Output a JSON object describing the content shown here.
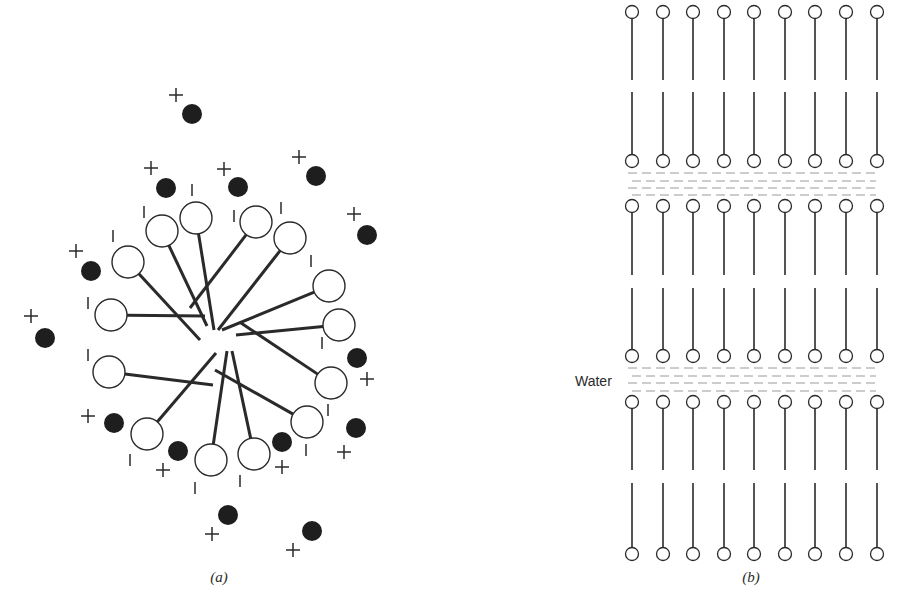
{
  "figure": {
    "panels": [
      {
        "id": "a",
        "label": "(a)",
        "description": "Spherical micelle with counter-ions",
        "micelle_center": [
          220,
          335
        ],
        "amphiphiles": [
          {
            "head": [
              111,
              315
            ],
            "tail_end": [
              205,
              316
            ],
            "charge": "|",
            "charge_pos": [
              88,
              303
            ]
          },
          {
            "head": [
              128,
              262
            ],
            "tail_end": [
              200,
              340
            ],
            "charge": "|",
            "charge_pos": [
              113,
              236
            ]
          },
          {
            "head": [
              162,
              231
            ],
            "tail_end": [
              207,
              326
            ],
            "charge": "|",
            "charge_pos": [
              144,
              212
            ]
          },
          {
            "head": [
              196,
              218
            ],
            "tail_end": [
              214,
              330
            ],
            "charge": "|",
            "charge_pos": [
              192,
              190
            ]
          },
          {
            "head": [
              256,
              222
            ],
            "tail_end": [
              190,
              308
            ],
            "charge": "|",
            "charge_pos": [
              234,
              216
            ]
          },
          {
            "head": [
              290,
              238
            ],
            "tail_end": [
              218,
              330
            ],
            "charge": "|",
            "charge_pos": [
              281,
              208
            ]
          },
          {
            "head": [
              329,
              286
            ],
            "tail_end": [
              222,
              330
            ],
            "charge": "|",
            "charge_pos": [
              311,
              261
            ]
          },
          {
            "head": [
              339,
              325
            ],
            "tail_end": [
              236,
              335
            ],
            "charge": "|",
            "charge_pos": [
              322,
              343
            ]
          },
          {
            "head": [
              331,
              383
            ],
            "tail_end": [
              241,
              323
            ],
            "charge": "|",
            "charge_pos": [
              328,
              410
            ]
          },
          {
            "head": [
              307,
              422
            ],
            "tail_end": [
              215,
              370
            ],
            "charge": "|",
            "charge_pos": [
              306,
              450
            ]
          },
          {
            "head": [
              254,
              454
            ],
            "tail_end": [
              232,
              351
            ],
            "charge": "|",
            "charge_pos": [
              240,
              481
            ]
          },
          {
            "head": [
              211,
              460
            ],
            "tail_end": [
              227,
              351
            ],
            "charge": "|",
            "charge_pos": [
              195,
              488
            ]
          },
          {
            "head": [
              147,
              434
            ],
            "tail_end": [
              216,
              353
            ],
            "charge": "|",
            "charge_pos": [
              130,
              460
            ]
          },
          {
            "head": [
              109,
              372
            ],
            "tail_end": [
              213,
              385
            ],
            "charge": "|",
            "charge_pos": [
              88,
              355
            ]
          }
        ],
        "counter_ions": [
          {
            "ion": [
              192,
              114
            ],
            "sign": "+",
            "sign_pos": [
              176,
              95
            ]
          },
          {
            "ion": [
              166,
              188
            ],
            "sign": "+",
            "sign_pos": [
              151,
              168
            ]
          },
          {
            "ion": [
              238,
              187
            ],
            "sign": "+",
            "sign_pos": [
              224,
              169
            ]
          },
          {
            "ion": [
              316,
              176
            ],
            "sign": "+",
            "sign_pos": [
              299,
              157
            ]
          },
          {
            "ion": [
              367,
              235
            ],
            "sign": "+",
            "sign_pos": [
              354,
              214
            ]
          },
          {
            "ion": [
              91,
              271
            ],
            "sign": "+",
            "sign_pos": [
              76,
              251
            ]
          },
          {
            "ion": [
              45,
              338
            ],
            "sign": "+",
            "sign_pos": [
              31,
              316
            ]
          },
          {
            "ion": [
              357,
              358
            ],
            "sign": "+",
            "sign_pos": [
              367,
              379
            ]
          },
          {
            "ion": [
              356,
              428
            ],
            "sign": "+",
            "sign_pos": [
              344,
              452
            ]
          },
          {
            "ion": [
              114,
              423
            ],
            "sign": "+",
            "sign_pos": [
              88,
              416
            ]
          },
          {
            "ion": [
              178,
              451
            ],
            "sign": "+",
            "sign_pos": [
              163,
              470
            ]
          },
          {
            "ion": [
              282,
              442
            ],
            "sign": "+",
            "sign_pos": [
              282,
              467
            ]
          },
          {
            "ion": [
              228,
              515
            ],
            "sign": "+",
            "sign_pos": [
              212,
              534
            ]
          },
          {
            "ion": [
              312,
              531
            ],
            "sign": "+",
            "sign_pos": [
              293,
              550
            ]
          }
        ]
      },
      {
        "id": "b",
        "label": "(b)",
        "description": "Lamellar bilayer structure separated by water layers",
        "water_label": "Water",
        "columns_x": [
          632,
          663,
          693,
          724,
          754,
          785,
          815,
          846,
          877
        ],
        "layers": [
          {
            "top_head_y": 12,
            "bottom_head_y": 161,
            "gap_y": [
              80,
              92
            ]
          },
          {
            "top_head_y": 206,
            "bottom_head_y": 356,
            "gap_y": [
              275,
              288
            ]
          },
          {
            "top_head_y": 402,
            "bottom_head_y": 554,
            "gap_y": [
              470,
              483
            ]
          }
        ],
        "water_bands": [
          {
            "dash_rows_y": [
              173,
              181,
              188,
              195
            ]
          },
          {
            "dash_rows_y": [
              368,
              376,
              383,
              391
            ]
          }
        ]
      }
    ],
    "caption_partial": ""
  },
  "colors": {
    "ink": "#2a2a2a",
    "ion_fill": "#1e1e1e",
    "head_fill": "#ffffff",
    "water_dash": "#9a9a9a",
    "background": "#ffffff"
  }
}
